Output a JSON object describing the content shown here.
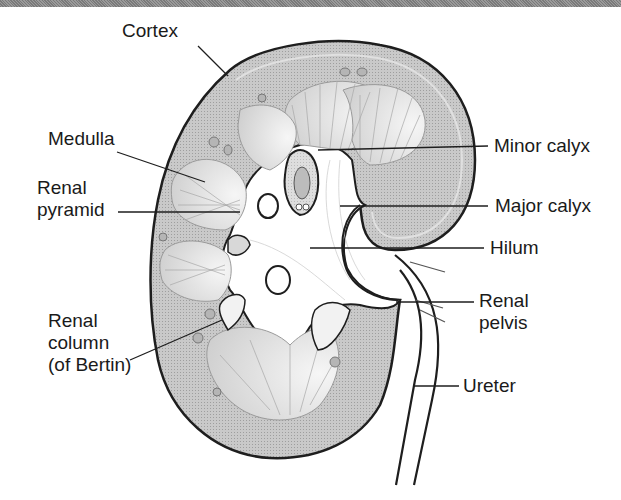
{
  "diagram": {
    "type": "anatomical cross-section",
    "colors": {
      "cortex_fill": "#c4c4c4",
      "medulla_fill": "#dcdcdc",
      "outline": "#1e1e1e",
      "sinus_fill": "#ffffff",
      "label_text": "#1a1a1a",
      "top_bar": "#8a8a8a"
    }
  },
  "labels": {
    "cortex": "Cortex",
    "medulla": "Medulla",
    "renal_pyramid": [
      "Renal",
      "pyramid"
    ],
    "renal_column": [
      "Renal",
      "column",
      "(of Bertin)"
    ],
    "minor_calyx": "Minor calyx",
    "major_calyx": "Major calyx",
    "hilum": "Hilum",
    "renal_pelvis": [
      "Renal",
      "pelvis"
    ],
    "ureter": "Ureter"
  }
}
